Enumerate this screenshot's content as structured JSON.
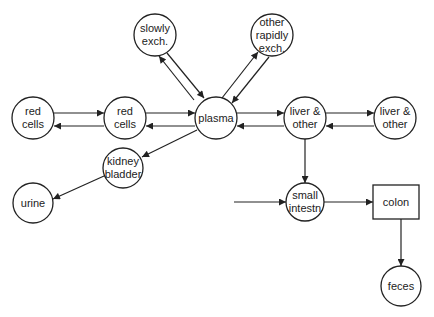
{
  "diagram": {
    "nodes": [
      {
        "id": "red-cells-1",
        "shape": "circle",
        "cx": 33,
        "cy": 118,
        "r": 21,
        "lines": [
          "red",
          "cells"
        ]
      },
      {
        "id": "red-cells-2",
        "shape": "circle",
        "cx": 125,
        "cy": 118,
        "r": 21,
        "lines": [
          "red",
          "cells"
        ]
      },
      {
        "id": "plasma",
        "shape": "circle",
        "cx": 216,
        "cy": 118,
        "r": 21,
        "lines": [
          "plasma"
        ]
      },
      {
        "id": "slowly-exch",
        "shape": "circle",
        "cx": 155,
        "cy": 35,
        "r": 21,
        "lines": [
          "slowly",
          "exch."
        ]
      },
      {
        "id": "other-rapidly-exch",
        "shape": "circle",
        "cx": 272,
        "cy": 35,
        "r": 21,
        "lines": [
          "other",
          "rapidly",
          "exch."
        ]
      },
      {
        "id": "liver-other-1",
        "shape": "circle",
        "cx": 305,
        "cy": 118,
        "r": 21,
        "lines": [
          "liver &",
          "other"
        ]
      },
      {
        "id": "liver-other-2",
        "shape": "circle",
        "cx": 395,
        "cy": 118,
        "r": 21,
        "lines": [
          "liver &",
          "other"
        ]
      },
      {
        "id": "kidney-bladder",
        "shape": "circle",
        "cx": 123,
        "cy": 168,
        "r": 20,
        "lines": [
          "kidney",
          "bladder"
        ]
      },
      {
        "id": "urine",
        "shape": "circle",
        "cx": 33,
        "cy": 203,
        "r": 20,
        "lines": [
          "urine"
        ]
      },
      {
        "id": "small-intestn",
        "shape": "circle",
        "cx": 305,
        "cy": 202,
        "r": 19,
        "lines": [
          "small",
          "intestn"
        ]
      },
      {
        "id": "colon",
        "shape": "rect",
        "x": 373,
        "y": 185,
        "w": 46,
        "h": 34,
        "lines": [
          "colon"
        ]
      },
      {
        "id": "feces",
        "shape": "circle",
        "cx": 401,
        "cy": 286,
        "r": 20,
        "lines": [
          "feces"
        ]
      }
    ],
    "edges": [
      {
        "from": "red-cells-1",
        "to": "red-cells-2",
        "points": [
          [
            54,
            113
          ],
          [
            104,
            113
          ]
        ]
      },
      {
        "from": "red-cells-2",
        "to": "red-cells-1",
        "points": [
          [
            104,
            126
          ],
          [
            54,
            126
          ]
        ]
      },
      {
        "from": "red-cells-2",
        "to": "plasma",
        "points": [
          [
            146,
            113
          ],
          [
            195,
            113
          ]
        ]
      },
      {
        "from": "plasma",
        "to": "red-cells-2",
        "points": [
          [
            195,
            126
          ],
          [
            146,
            126
          ]
        ]
      },
      {
        "from": "plasma",
        "to": "slowly-exch",
        "points": [
          [
            194,
            100
          ],
          [
            159,
            56
          ]
        ]
      },
      {
        "from": "slowly-exch",
        "to": "plasma",
        "points": [
          [
            167,
            53
          ],
          [
            204,
            98
          ]
        ]
      },
      {
        "from": "plasma",
        "to": "other-rapidly-exch",
        "points": [
          [
            222,
            98
          ],
          [
            258,
            52
          ]
        ]
      },
      {
        "from": "other-rapidly-exch",
        "to": "plasma",
        "points": [
          [
            269,
            57
          ],
          [
            232,
            103
          ]
        ]
      },
      {
        "from": "plasma",
        "to": "liver-other-1",
        "points": [
          [
            237,
            113
          ],
          [
            284,
            113
          ]
        ]
      },
      {
        "from": "liver-other-1",
        "to": "plasma",
        "points": [
          [
            284,
            126
          ],
          [
            237,
            126
          ]
        ]
      },
      {
        "from": "liver-other-1",
        "to": "liver-other-2",
        "points": [
          [
            326,
            113
          ],
          [
            374,
            113
          ]
        ]
      },
      {
        "from": "liver-other-2",
        "to": "liver-other-1",
        "points": [
          [
            374,
            126
          ],
          [
            326,
            126
          ]
        ]
      },
      {
        "from": "plasma",
        "to": "kidney-bladder",
        "points": [
          [
            197,
            130
          ],
          [
            142,
            157
          ]
        ]
      },
      {
        "from": "kidney-bladder",
        "to": "urine",
        "points": [
          [
            104,
            176
          ],
          [
            53,
            199
          ]
        ]
      },
      {
        "from": "liver-other-1",
        "to": "small-intestn",
        "points": [
          [
            305,
            139
          ],
          [
            305,
            183
          ]
        ]
      },
      {
        "from": "external",
        "to": "small-intestn",
        "points": [
          [
            234,
            202
          ],
          [
            286,
            202
          ]
        ]
      },
      {
        "from": "small-intestn",
        "to": "colon",
        "points": [
          [
            324,
            202
          ],
          [
            373,
            202
          ]
        ]
      },
      {
        "from": "colon",
        "to": "feces",
        "points": [
          [
            401,
            219
          ],
          [
            401,
            266
          ]
        ]
      }
    ]
  }
}
